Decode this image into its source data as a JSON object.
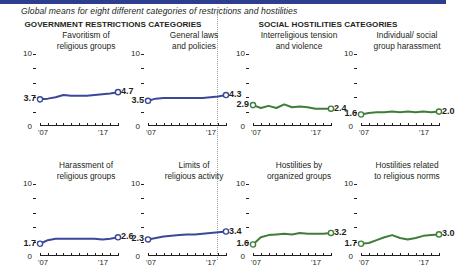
{
  "topbar_color": "#2d3e8f",
  "subtitle": "Global means for eight different categories of restrictions and hostilities",
  "sections": {
    "government": "GOVERNMENT RESTRICTIONS CATEGORIES",
    "social": "SOCIAL HOSTILITIES CATEGORIES"
  },
  "axis": {
    "y_top": "10",
    "y_bottom": "0",
    "x_start": "'07",
    "x_end": "'17"
  },
  "colors": {
    "government_line": "#3b4899",
    "social_line": "#3f7d3b",
    "text": "#231f20",
    "divider": "#9aa0a6"
  },
  "chart_data": {
    "type": "line",
    "title": "Global means for eight different categories of restrictions and hostilities",
    "xlabel": "",
    "ylabel": "",
    "ylim": [
      0,
      10
    ],
    "xlim": [
      2007,
      2017
    ],
    "x": [
      2007,
      2008,
      2009,
      2010,
      2011,
      2012,
      2013,
      2014,
      2015,
      2016,
      2017
    ],
    "grid": false,
    "legend": "none",
    "panels": [
      {
        "id": "favoritism-of-religious-groups",
        "group": "GOVERNMENT RESTRICTIONS CATEGORIES",
        "title_line1": "Favoritism of",
        "title_line2": "religious groups",
        "color": "#3b4899",
        "start_label": "3.7",
        "end_label": "4.7",
        "values": [
          3.7,
          3.8,
          4.0,
          4.3,
          4.2,
          4.2,
          4.2,
          4.3,
          4.4,
          4.5,
          4.7
        ]
      },
      {
        "id": "general-laws-and-policies",
        "group": "GOVERNMENT RESTRICTIONS CATEGORIES",
        "title_line1": "General laws",
        "title_line2": "and policies",
        "color": "#3b4899",
        "start_label": "3.5",
        "end_label": "4.3",
        "values": [
          3.5,
          3.8,
          3.9,
          3.9,
          3.9,
          3.9,
          3.9,
          3.9,
          4.0,
          4.1,
          4.3
        ]
      },
      {
        "id": "interreligious-tension-and-violence",
        "group": "SOCIAL HOSTILITIES CATEGORIES",
        "title_line1": "Interreligious tension",
        "title_line2": "and violence",
        "color": "#3f7d3b",
        "start_label": "2.9",
        "end_label": "2.4",
        "values": [
          2.9,
          2.5,
          2.8,
          2.5,
          3.0,
          2.6,
          2.7,
          2.6,
          2.4,
          2.4,
          2.4
        ]
      },
      {
        "id": "individual-social-group-harassment",
        "group": "SOCIAL HOSTILITIES CATEGORIES",
        "title_line1": "Individual/ social",
        "title_line2": "group harassment",
        "color": "#3f7d3b",
        "start_label": "1.6",
        "end_label": "2.0",
        "values": [
          1.6,
          1.8,
          1.9,
          1.9,
          2.0,
          1.9,
          2.0,
          1.9,
          2.0,
          1.9,
          2.0
        ]
      },
      {
        "id": "harassment-of-religious-groups",
        "group": "GOVERNMENT RESTRICTIONS CATEGORIES",
        "title_line1": "Harassment of",
        "title_line2": "religious groups",
        "color": "#3b4899",
        "start_label": "1.7",
        "end_label": "2.6",
        "values": [
          1.7,
          2.2,
          2.4,
          2.4,
          2.4,
          2.4,
          2.4,
          2.4,
          2.3,
          2.4,
          2.6
        ]
      },
      {
        "id": "limits-of-religious-activity",
        "group": "GOVERNMENT RESTRICTIONS CATEGORIES",
        "title_line1": "Limits of",
        "title_line2": "religious activity",
        "color": "#3b4899",
        "start_label": "2.3",
        "end_label": "3.4",
        "values": [
          2.3,
          2.5,
          2.7,
          2.8,
          2.9,
          3.0,
          3.0,
          3.1,
          3.2,
          3.3,
          3.4
        ]
      },
      {
        "id": "hostilities-by-organized-groups",
        "group": "SOCIAL HOSTILITIES CATEGORIES",
        "title_line1": "Hostilities by",
        "title_line2": "organized groups",
        "color": "#3f7d3b",
        "start_label": "1.6",
        "end_label": "3.2",
        "values": [
          1.6,
          2.6,
          2.9,
          3.0,
          3.1,
          3.0,
          3.2,
          3.1,
          3.1,
          3.1,
          3.2
        ]
      },
      {
        "id": "hostilities-related-to-religious-norms",
        "group": "SOCIAL HOSTILITIES CATEGORIES",
        "title_line1": "Hostilities related",
        "title_line2": "to religious norms",
        "color": "#3f7d3b",
        "start_label": "1.7",
        "end_label": "3.0",
        "values": [
          1.7,
          1.8,
          2.2,
          2.6,
          2.9,
          2.5,
          2.3,
          2.5,
          2.8,
          2.9,
          3.0
        ]
      }
    ]
  }
}
